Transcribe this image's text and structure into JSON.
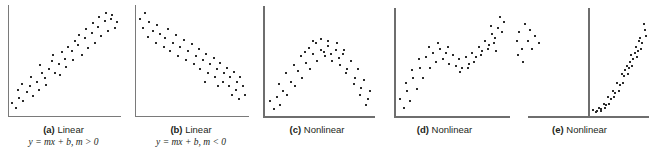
{
  "figure": {
    "panels": [
      {
        "id": "a",
        "letter": "(a)",
        "title": "Linear",
        "equation": "y = mx + b, m > 0",
        "caption_full": "(a) Linear  y = mx + b, m > 0"
      },
      {
        "id": "b",
        "letter": "(b)",
        "title": "Linear",
        "equation": "y = mx + b, m < 0",
        "caption_full": "(b) Linear  y = mx + b, m < 0"
      },
      {
        "id": "c",
        "letter": "(c)",
        "title": "Nonlinear",
        "equation": "",
        "caption_full": "(c) Nonlinear"
      },
      {
        "id": "d",
        "letter": "(d)",
        "title": "Nonlinear",
        "equation": "",
        "caption_full": "(d) Nonlinear"
      },
      {
        "id": "e",
        "letter": "(e)",
        "title": "Nonlinear",
        "equation": "",
        "caption_full": "(e) Nonlinear"
      }
    ],
    "colors": {
      "background": "#ffffff",
      "axis": "#7a7a7a",
      "point": "#2b2b2b",
      "text": "#231f20"
    }
  },
  "chart_data": [
    {
      "type": "scatter",
      "title": "(a) Linear",
      "annotations": [
        "y = mx + b, m > 0"
      ],
      "xlabel": "",
      "ylabel": "",
      "grid": false,
      "legend": "none",
      "xlim": [
        0,
        100
      ],
      "ylim": [
        0,
        100
      ],
      "points": [
        [
          3,
          10
        ],
        [
          6,
          6
        ],
        [
          9,
          15
        ],
        [
          8,
          22
        ],
        [
          13,
          12
        ],
        [
          16,
          20
        ],
        [
          12,
          28
        ],
        [
          19,
          26
        ],
        [
          22,
          17
        ],
        [
          20,
          34
        ],
        [
          25,
          30
        ],
        [
          27,
          22
        ],
        [
          30,
          38
        ],
        [
          28,
          45
        ],
        [
          33,
          33
        ],
        [
          36,
          42
        ],
        [
          34,
          27
        ],
        [
          39,
          49
        ],
        [
          42,
          38
        ],
        [
          40,
          55
        ],
        [
          45,
          46
        ],
        [
          48,
          57
        ],
        [
          46,
          36
        ],
        [
          51,
          51
        ],
        [
          54,
          62
        ],
        [
          52,
          44
        ],
        [
          57,
          58
        ],
        [
          60,
          68
        ],
        [
          58,
          50
        ],
        [
          63,
          64
        ],
        [
          66,
          55
        ],
        [
          64,
          73
        ],
        [
          69,
          70
        ],
        [
          72,
          61
        ],
        [
          70,
          79
        ],
        [
          75,
          75
        ],
        [
          78,
          66
        ],
        [
          76,
          84
        ],
        [
          81,
          81
        ],
        [
          84,
          72
        ],
        [
          82,
          90
        ],
        [
          87,
          86
        ],
        [
          90,
          77
        ],
        [
          88,
          94
        ],
        [
          93,
          88
        ],
        [
          96,
          80
        ],
        [
          94,
          92
        ],
        [
          98,
          85
        ]
      ]
    },
    {
      "type": "scatter",
      "title": "(b) Linear",
      "annotations": [
        "y = mx + b, m < 0"
      ],
      "xlabel": "",
      "ylabel": "",
      "grid": false,
      "legend": "none",
      "xlim": [
        0,
        100
      ],
      "ylim": [
        0,
        100
      ],
      "points": [
        [
          4,
          88
        ],
        [
          8,
          94
        ],
        [
          6,
          80
        ],
        [
          12,
          85
        ],
        [
          15,
          77
        ],
        [
          11,
          71
        ],
        [
          19,
          82
        ],
        [
          22,
          74
        ],
        [
          18,
          66
        ],
        [
          26,
          70
        ],
        [
          29,
          79
        ],
        [
          25,
          62
        ],
        [
          33,
          66
        ],
        [
          36,
          73
        ],
        [
          31,
          58
        ],
        [
          40,
          62
        ],
        [
          43,
          69
        ],
        [
          38,
          54
        ],
        [
          47,
          58
        ],
        [
          50,
          65
        ],
        [
          45,
          50
        ],
        [
          54,
          54
        ],
        [
          57,
          60
        ],
        [
          52,
          46
        ],
        [
          60,
          50
        ],
        [
          63,
          56
        ],
        [
          58,
          42
        ],
        [
          67,
          46
        ],
        [
          70,
          52
        ],
        [
          65,
          38
        ],
        [
          73,
          42
        ],
        [
          76,
          47
        ],
        [
          71,
          34
        ],
        [
          79,
          38
        ],
        [
          82,
          43
        ],
        [
          78,
          30
        ],
        [
          85,
          34
        ],
        [
          88,
          39
        ],
        [
          84,
          26
        ],
        [
          91,
          30
        ],
        [
          94,
          34
        ],
        [
          90,
          22
        ],
        [
          96,
          26
        ],
        [
          98,
          18
        ],
        [
          93,
          14
        ],
        [
          86,
          18
        ],
        [
          74,
          26
        ],
        [
          62,
          30
        ]
      ]
    },
    {
      "type": "scatter",
      "title": "(c) Nonlinear",
      "annotations": [],
      "xlabel": "",
      "ylabel": "",
      "grid": false,
      "legend": "none",
      "xlim": [
        0,
        100
      ],
      "ylim": [
        0,
        100
      ],
      "shape": "inverted-parabola",
      "points": [
        [
          4,
          12
        ],
        [
          7,
          5
        ],
        [
          10,
          16
        ],
        [
          13,
          8
        ],
        [
          16,
          22
        ],
        [
          12,
          28
        ],
        [
          20,
          18
        ],
        [
          23,
          30
        ],
        [
          19,
          38
        ],
        [
          27,
          26
        ],
        [
          30,
          40
        ],
        [
          26,
          46
        ],
        [
          34,
          34
        ],
        [
          37,
          48
        ],
        [
          33,
          54
        ],
        [
          41,
          42
        ],
        [
          44,
          56
        ],
        [
          40,
          62
        ],
        [
          48,
          50
        ],
        [
          51,
          60
        ],
        [
          47,
          66
        ],
        [
          55,
          54
        ],
        [
          58,
          64
        ],
        [
          54,
          58
        ],
        [
          62,
          50
        ],
        [
          65,
          60
        ],
        [
          61,
          56
        ],
        [
          69,
          46
        ],
        [
          72,
          56
        ],
        [
          68,
          52
        ],
        [
          76,
          42
        ],
        [
          79,
          50
        ],
        [
          75,
          38
        ],
        [
          83,
          34
        ],
        [
          86,
          42
        ],
        [
          82,
          28
        ],
        [
          89,
          24
        ],
        [
          92,
          32
        ],
        [
          88,
          18
        ],
        [
          95,
          14
        ],
        [
          97,
          22
        ],
        [
          93,
          8
        ],
        [
          44,
          68
        ],
        [
          51,
          70
        ],
        [
          58,
          68
        ],
        [
          36,
          58
        ],
        [
          66,
          66
        ],
        [
          73,
          60
        ]
      ]
    },
    {
      "type": "scatter",
      "title": "(d) Nonlinear",
      "annotations": [],
      "xlabel": "",
      "ylabel": "",
      "grid": false,
      "legend": "none",
      "xlim": [
        0,
        100
      ],
      "ylim": [
        0,
        100
      ],
      "shape": "cubic-s-curve",
      "points": [
        [
          3,
          14
        ],
        [
          6,
          6
        ],
        [
          9,
          22
        ],
        [
          12,
          12
        ],
        [
          8,
          30
        ],
        [
          15,
          34
        ],
        [
          18,
          24
        ],
        [
          14,
          42
        ],
        [
          21,
          44
        ],
        [
          24,
          34
        ],
        [
          20,
          52
        ],
        [
          27,
          54
        ],
        [
          30,
          44
        ],
        [
          33,
          58
        ],
        [
          29,
          64
        ],
        [
          36,
          50
        ],
        [
          39,
          62
        ],
        [
          42,
          52
        ],
        [
          38,
          68
        ],
        [
          45,
          58
        ],
        [
          48,
          48
        ],
        [
          51,
          56
        ],
        [
          54,
          46
        ],
        [
          47,
          64
        ],
        [
          57,
          52
        ],
        [
          60,
          44
        ],
        [
          63,
          54
        ],
        [
          58,
          40
        ],
        [
          66,
          48
        ],
        [
          69,
          58
        ],
        [
          65,
          44
        ],
        [
          72,
          54
        ],
        [
          75,
          64
        ],
        [
          71,
          50
        ],
        [
          78,
          60
        ],
        [
          81,
          70
        ],
        [
          77,
          56
        ],
        [
          84,
          66
        ],
        [
          87,
          76
        ],
        [
          83,
          62
        ],
        [
          90,
          72
        ],
        [
          93,
          82
        ],
        [
          89,
          68
        ],
        [
          96,
          78
        ],
        [
          98,
          88
        ],
        [
          94,
          92
        ],
        [
          91,
          60
        ],
        [
          86,
          84
        ]
      ]
    },
    {
      "type": "scatter",
      "title": "(e) Nonlinear",
      "annotations": [],
      "xlabel": "",
      "ylabel": "",
      "grid": false,
      "legend": "none",
      "xlim": [
        -50,
        100
      ],
      "ylim": [
        0,
        100
      ],
      "shape": "exponential",
      "points": [
        [
          6,
          4
        ],
        [
          12,
          3
        ],
        [
          16,
          6
        ],
        [
          10,
          2
        ],
        [
          20,
          5
        ],
        [
          24,
          10
        ],
        [
          19,
          3
        ],
        [
          28,
          9
        ],
        [
          32,
          16
        ],
        [
          26,
          6
        ],
        [
          36,
          14
        ],
        [
          40,
          22
        ],
        [
          34,
          10
        ],
        [
          44,
          20
        ],
        [
          48,
          30
        ],
        [
          42,
          16
        ],
        [
          52,
          28
        ],
        [
          56,
          38
        ],
        [
          50,
          22
        ],
        [
          60,
          36
        ],
        [
          64,
          46
        ],
        [
          58,
          30
        ],
        [
          68,
          44
        ],
        [
          72,
          56
        ],
        [
          66,
          38
        ],
        [
          76,
          52
        ],
        [
          80,
          64
        ],
        [
          74,
          46
        ],
        [
          84,
          60
        ],
        [
          88,
          72
        ],
        [
          82,
          54
        ],
        [
          92,
          68
        ],
        [
          96,
          80
        ],
        [
          90,
          62
        ],
        [
          98,
          74
        ],
        [
          94,
          86
        ],
        [
          86,
          70
        ],
        [
          78,
          58
        ],
        [
          70,
          50
        ],
        [
          62,
          42
        ]
      ],
      "left_cluster_points": [
        [
          -44,
          78
        ],
        [
          -40,
          86
        ],
        [
          -46,
          70
        ],
        [
          -36,
          80
        ],
        [
          -42,
          62
        ],
        [
          -38,
          70
        ],
        [
          -33,
          74
        ],
        [
          -45,
          56
        ],
        [
          -35,
          62
        ],
        [
          -30,
          68
        ],
        [
          -41,
          50
        ]
      ]
    }
  ]
}
